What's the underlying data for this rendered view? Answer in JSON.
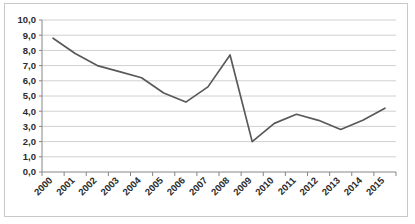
{
  "chart_data": {
    "type": "line",
    "title": "",
    "subtitle": "",
    "xlabel": "",
    "ylabel": "",
    "grid": true,
    "legend": false,
    "legend_position": "none",
    "decimal_separator": ",",
    "line_color": "#595959",
    "gridline_color": "#d0d0d0",
    "axis_color": "#868686",
    "border_color": "#c9c9c9",
    "background_color": "#ffffff",
    "ylim": [
      0.0,
      10.0
    ],
    "ytick_step": 1.0,
    "ytick_labels": [
      "0,0",
      "1,0",
      "2,0",
      "3,0",
      "4,0",
      "5,0",
      "6,0",
      "7,0",
      "8,0",
      "9,0",
      "10,0"
    ],
    "ytick_values": [
      0.0,
      1.0,
      2.0,
      3.0,
      4.0,
      5.0,
      6.0,
      7.0,
      8.0,
      9.0,
      10.0
    ],
    "categories": [
      "2000",
      "2001",
      "2002",
      "2003",
      "2004",
      "2005",
      "2006",
      "2007",
      "2008",
      "2009",
      "2010",
      "2011",
      "2012",
      "2013",
      "2014",
      "2015"
    ],
    "values": [
      8.8,
      7.8,
      7.0,
      6.6,
      6.2,
      5.2,
      4.6,
      5.6,
      7.7,
      2.0,
      3.2,
      3.8,
      3.4,
      2.8,
      3.4,
      4.2
    ]
  }
}
